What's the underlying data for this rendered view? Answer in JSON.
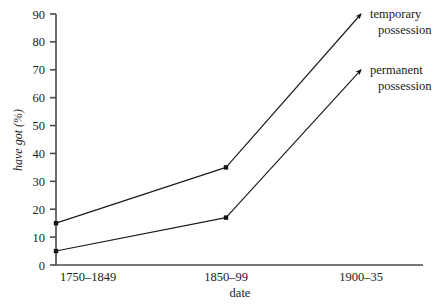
{
  "chart_data": {
    "type": "line",
    "title": "",
    "xlabel": "date",
    "ylabel": "have got (%)",
    "categories": [
      "1750–1849",
      "1850–99",
      "1900–35"
    ],
    "ylim": [
      0,
      90
    ],
    "yticks": [
      0,
      10,
      20,
      30,
      40,
      50,
      60,
      70,
      80,
      90
    ],
    "ytick_labels": [
      "0",
      "10",
      "20",
      "30",
      "40",
      "50",
      "60",
      "70",
      "80",
      "90"
    ],
    "grid": false,
    "legend_position": "right-inline-at-line-ends",
    "series": [
      {
        "name": "temporary possession",
        "label_line1": "temporary",
        "label_line2": "possession",
        "values": [
          15,
          35,
          90
        ],
        "color": "#111111",
        "marker": "square",
        "terminus": "arrow"
      },
      {
        "name": "permanent possession",
        "label_line1": "permanent",
        "label_line2": "possession",
        "values": [
          5,
          17,
          70
        ],
        "color": "#111111",
        "marker": "square",
        "terminus": "arrow"
      }
    ]
  },
  "axes": {
    "y_axis_color": "#4b4b4b",
    "x_axis_color": "#4b4b4b"
  }
}
